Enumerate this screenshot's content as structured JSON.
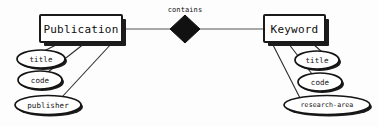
{
  "diagram": {
    "type": "entity-relationship-diagram",
    "background_color": "#fdfdfd",
    "ink_color": "#111111",
    "entities": [
      {
        "id": "publication",
        "label": "Publication",
        "x": 40,
        "y": 15,
        "width": 82,
        "height": 27,
        "attributes": [
          {
            "id": "pub-title",
            "label": "title",
            "cx": 41,
            "cy": 59,
            "rx": 24,
            "ry": 9
          },
          {
            "id": "pub-code",
            "label": "code",
            "cx": 40,
            "cy": 80,
            "rx": 22,
            "ry": 9
          },
          {
            "id": "pub-publisher",
            "label": "publisher",
            "cx": 48,
            "cy": 105,
            "rx": 33,
            "ry": 9.5
          }
        ]
      },
      {
        "id": "keyword",
        "label": "Keyword",
        "x": 264,
        "y": 15,
        "width": 61,
        "height": 27,
        "attributes": [
          {
            "id": "kw-title",
            "label": "title",
            "cx": 317,
            "cy": 60,
            "rx": 22,
            "ry": 9
          },
          {
            "id": "kw-code",
            "label": "code",
            "cx": 320,
            "cy": 82,
            "rx": 22,
            "ry": 9
          },
          {
            "id": "kw-research-area",
            "label": "research-area",
            "cx": 327,
            "cy": 105,
            "rx": 43,
            "ry": 9.5
          }
        ]
      }
    ],
    "relationship": {
      "id": "contains",
      "label": "contains",
      "label_x": 185,
      "label_y": 10,
      "diamond_cx": 185,
      "diamond_cy": 29,
      "diamond_half_width": 15,
      "diamond_half_height": 14,
      "connects": [
        "publication",
        "keyword"
      ]
    }
  }
}
